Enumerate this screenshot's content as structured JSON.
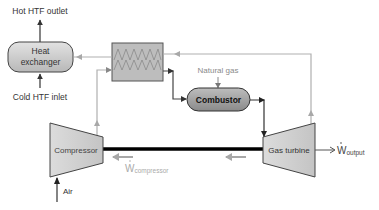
{
  "diagram": {
    "nodes": {
      "heat_exchanger": {
        "line1": "Heat",
        "line2": "exchanger"
      },
      "recuperator": {
        "label": ""
      },
      "combustor": {
        "label": "Combustor"
      },
      "compressor": {
        "label": "Compressor"
      },
      "gas_turbine": {
        "label": "Gas turbine"
      }
    },
    "labels": {
      "hot_htf_outlet": "Hot HTF outlet",
      "cold_htf_inlet": "Cold HTF inlet",
      "natural_gas": "Natural gas",
      "air": "Air",
      "w_compressor_main": "W",
      "w_compressor_sub": "compressor",
      "w_output_main": "W",
      "w_output_sub": "output"
    },
    "colors": {
      "box_fill": "#c8c8c8",
      "box_stroke": "#555555",
      "combustor_fill": "#9a9a9a",
      "line_dark": "#333333",
      "line_light": "#b0b0b0",
      "text_dark": "#222222",
      "text_light": "#9a9a9a",
      "shaft": "#000000"
    }
  }
}
